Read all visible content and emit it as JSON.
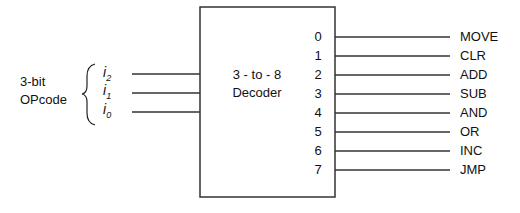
{
  "diagram": {
    "input_group_label": [
      "3-bit",
      "OPcode"
    ],
    "inputs": [
      {
        "name": "i",
        "sub": "2"
      },
      {
        "name": "i",
        "sub": "1"
      },
      {
        "name": "i",
        "sub": "0"
      }
    ],
    "decoder": {
      "title_line1": "3 - to - 8",
      "title_line2": "Decoder"
    },
    "outputs": [
      {
        "index": "0",
        "label": "MOVE"
      },
      {
        "index": "1",
        "label": "CLR"
      },
      {
        "index": "2",
        "label": "ADD"
      },
      {
        "index": "3",
        "label": "SUB"
      },
      {
        "index": "4",
        "label": "AND"
      },
      {
        "index": "5",
        "label": "OR"
      },
      {
        "index": "6",
        "label": "INC"
      },
      {
        "index": "7",
        "label": "JMP"
      }
    ]
  }
}
